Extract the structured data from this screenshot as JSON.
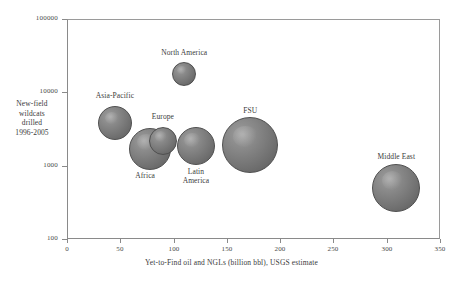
{
  "chart_data": {
    "type": "scatter",
    "title": "",
    "xlabel": "Yet-to-Find oil and NGLs (billion bbl), USGS estimate",
    "ylabel": "New-field\nwildcats\ndrilled\n1996-2005",
    "ylabel_lines": [
      "New-field",
      "wildcats",
      "drilled",
      "1996-2005"
    ],
    "xlim": [
      0,
      350
    ],
    "ylim": [
      100,
      100000
    ],
    "yscale": "log",
    "xticks": [
      0,
      50,
      100,
      150,
      200,
      250,
      300,
      350
    ],
    "xtick_labels": [
      "0",
      "50",
      "100",
      "150",
      "200",
      "250",
      "300",
      "350"
    ],
    "yticks": [
      100,
      1000,
      10000,
      100000
    ],
    "ytick_labels": [
      "100",
      "1000",
      "10000",
      "100000"
    ],
    "grid": false,
    "legend": "none",
    "bubble_color": "#7e7e7e",
    "bubble_edge_color": "#4f4f4f",
    "axis_color": "#8a8a8a",
    "text_color": "#3a3a3a",
    "points": [
      {
        "name": "Asia-Pacific",
        "x": 45,
        "y": 3800,
        "r_px": 17,
        "label_dx": 0,
        "label_dy": -27
      },
      {
        "name": "North America",
        "x": 110,
        "y": 18000,
        "r_px": 12,
        "label_dx": 0,
        "label_dy": -21
      },
      {
        "name": "Europe",
        "x": 90,
        "y": 2200,
        "r_px": 14,
        "label_dx": 0,
        "label_dy": -24
      },
      {
        "name": "Africa",
        "x": 78,
        "y": 1700,
        "r_px": 21,
        "label_dx": -5,
        "label_dy": 27
      },
      {
        "name": "Latin\nAmerica",
        "x": 121,
        "y": 1850,
        "r_px": 19,
        "label_dx": 0,
        "label_dy": 26
      },
      {
        "name": "FSU",
        "x": 172,
        "y": 1900,
        "r_px": 28,
        "label_dx": 0,
        "label_dy": -34
      },
      {
        "name": "Middle East",
        "x": 309,
        "y": 500,
        "r_px": 24,
        "label_dx": 0,
        "label_dy": -31
      }
    ]
  }
}
